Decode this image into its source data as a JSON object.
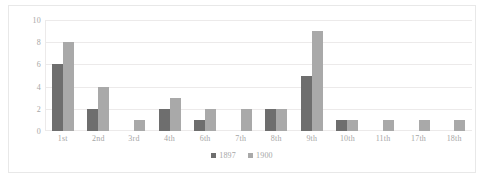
{
  "chart_data": {
    "type": "bar",
    "title": "",
    "subtitle": "",
    "xlabel": "",
    "ylabel": "",
    "ylim": [
      0,
      10
    ],
    "yticks": [
      0,
      2,
      4,
      6,
      8,
      10
    ],
    "grid": true,
    "legend_position": "bottom",
    "categories": [
      "1st",
      "2nd",
      "3rd",
      "4th",
      "6th",
      "7th",
      "8th",
      "9th",
      "10th",
      "11th",
      "17th",
      "18th"
    ],
    "series": [
      {
        "name": "1897",
        "color": "#6e6e6e",
        "values": [
          6,
          2,
          0,
          2,
          1,
          0,
          2,
          5,
          1,
          0,
          0,
          0
        ]
      },
      {
        "name": "1900",
        "color": "#a9a9a9",
        "values": [
          8,
          4,
          1,
          3,
          2,
          2,
          2,
          9,
          1,
          1,
          1,
          1
        ]
      }
    ]
  },
  "legend": {
    "items": [
      {
        "label": "1897",
        "color": "#6e6e6e"
      },
      {
        "label": "1900",
        "color": "#a9a9a9"
      }
    ]
  },
  "colors": {
    "series_1897": "#6e6e6e",
    "series_1900": "#a9a9a9",
    "gridline": "#eceaea",
    "tick_text": "#a6a6a6",
    "border": "#e8e8e8",
    "background": "#ffffff"
  }
}
